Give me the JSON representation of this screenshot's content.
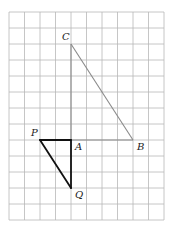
{
  "figure": {
    "grid": {
      "columns": 10,
      "rows": 13
    },
    "points": [
      {
        "name": "C",
        "label": "C",
        "col": 4,
        "row": 2,
        "label_pos": "upper-left"
      },
      {
        "name": "A",
        "label": "A",
        "col": 4,
        "row": 8,
        "label_pos": "lower-right"
      },
      {
        "name": "B",
        "label": "B",
        "col": 8,
        "row": 8,
        "label_pos": "lower-right"
      },
      {
        "name": "P",
        "label": "P",
        "col": 2,
        "row": 8,
        "label_pos": "upper-left"
      },
      {
        "name": "Q",
        "label": "Q",
        "col": 4,
        "row": 11,
        "label_pos": "lower-right"
      }
    ],
    "segments": [
      {
        "name": "CA",
        "from": "C",
        "to": "A",
        "style": "original"
      },
      {
        "name": "CB",
        "from": "C",
        "to": "B",
        "style": "original"
      },
      {
        "name": "AB",
        "from": "A",
        "to": "B",
        "style": "original"
      },
      {
        "name": "PA",
        "from": "P",
        "to": "A",
        "style": "image"
      },
      {
        "name": "AQ",
        "from": "A",
        "to": "Q",
        "style": "image"
      },
      {
        "name": "PQ",
        "from": "P",
        "to": "Q",
        "style": "image"
      }
    ],
    "colors": {
      "grid": "#b8b8b8",
      "original": "#8a8a8a",
      "image": "#111111"
    }
  }
}
